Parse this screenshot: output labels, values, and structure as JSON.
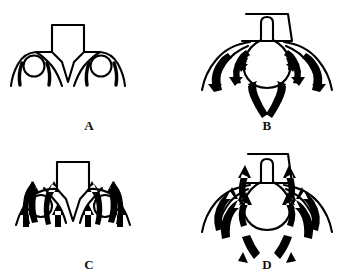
{
  "figure": {
    "type": "schematic-diagram",
    "background_color": "#ffffff",
    "ink_color": "#000000",
    "width": 356,
    "height": 277,
    "layout": "2x2 grid of labeled panels"
  },
  "panels": [
    {
      "id": "a",
      "label": "A",
      "grid_position": "top-left",
      "central_shape": "rectangle-with-v-point",
      "has_circles": true,
      "circle_count": 2,
      "has_arrows": false,
      "arrow_count": 0,
      "arrow_direction": "none",
      "wing_count": 2,
      "inner_arc_count": 4
    },
    {
      "id": "b",
      "label": "B",
      "grid_position": "top-right",
      "central_shape": "bulb-with-neck-and-collar",
      "has_circles": false,
      "circle_count": 0,
      "has_arrows": true,
      "arrow_count": 6,
      "arrow_direction": "inward-upward-converging",
      "wing_count": 2,
      "inner_arc_count": 2
    },
    {
      "id": "c",
      "label": "C",
      "grid_position": "bottom-left",
      "central_shape": "rectangle-with-v-point",
      "has_circles": true,
      "circle_count": 2,
      "has_arrows": true,
      "arrow_count": 8,
      "arrow_direction": "upward",
      "wing_count": 2,
      "inner_arc_count": 0
    },
    {
      "id": "d",
      "label": "D",
      "grid_position": "bottom-right",
      "central_shape": "bulb-with-neck-and-collar",
      "has_circles": false,
      "circle_count": 0,
      "has_arrows": true,
      "arrow_count": 8,
      "arrow_direction": "upward-outward-diverging",
      "wing_count": 2,
      "inner_arc_count": 2
    }
  ],
  "style": {
    "outline_stroke_width": 2,
    "label_font_weight": "bold",
    "label_font_size_px": 13
  }
}
